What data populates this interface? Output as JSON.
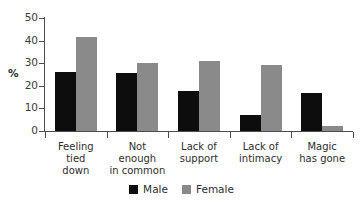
{
  "chart_data": {
    "type": "bar",
    "title": "",
    "subtitle": "",
    "xlabel": "",
    "ylabel": "%",
    "ylim": [
      0,
      50
    ],
    "yticks": [
      0,
      10,
      20,
      30,
      40,
      50
    ],
    "ytick_labels": [
      "0",
      "10",
      "20",
      "30",
      "40",
      "50"
    ],
    "grid": false,
    "legend_position": "bottom-center",
    "categories": [
      "Feeling\ntied\ndown",
      "Not\nenough\nin common",
      "Lack of\nsupport",
      "Lack of\nintimacy",
      "Magic\nhas gone"
    ],
    "series": [
      {
        "name": "Male",
        "color": "#0d0d0d",
        "values": [
          26,
          25.5,
          17.5,
          7,
          17
        ]
      },
      {
        "name": "Female",
        "color": "#8a8a8a",
        "values": [
          41.5,
          30,
          31,
          29,
          2
        ]
      }
    ]
  },
  "legend": {
    "items": [
      {
        "label": "Male",
        "swatch": "male-swatch"
      },
      {
        "label": "Female",
        "swatch": "female-swatch"
      }
    ]
  },
  "axis": {
    "y_title": "%"
  }
}
